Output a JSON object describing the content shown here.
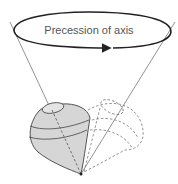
{
  "diagram": {
    "label": "Precession of axis",
    "colors": {
      "outline": "#222222",
      "cone_lines": "#777777",
      "top_fill": "#d6d6d6",
      "top_stroke": "#555555",
      "dashed": "#777777",
      "label": "#555555"
    },
    "elements": [
      "precession-ellipse-arrow",
      "precession-cone-lines",
      "spinning-top",
      "ghost-top-dashed",
      "axis-dashed-line"
    ]
  }
}
